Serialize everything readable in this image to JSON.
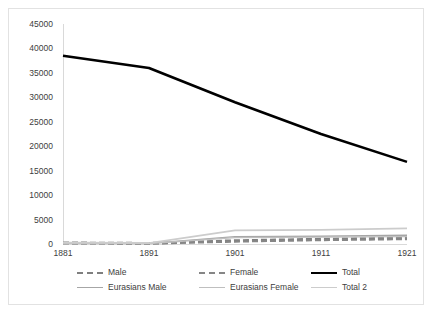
{
  "chart_data": {
    "type": "line",
    "title": "",
    "subtitle": "",
    "xlabel": "",
    "ylabel": "",
    "categories": [
      "1881",
      "1891",
      "1901",
      "1911",
      "1921"
    ],
    "x": [
      1881,
      1891,
      1901,
      1911,
      1921
    ],
    "xlim": [
      1881,
      1921
    ],
    "ylim": [
      0,
      45000
    ],
    "y_ticks": [
      "0",
      "5000",
      "10000",
      "15000",
      "20000",
      "25000",
      "30000",
      "35000",
      "40000",
      "45000"
    ],
    "y_tick_values": [
      0,
      5000,
      10000,
      15000,
      20000,
      25000,
      30000,
      35000,
      40000,
      45000
    ],
    "grid": false,
    "legend_position": "bottom",
    "series": [
      {
        "name": "Male",
        "values": [
          250,
          150,
          700,
          1000,
          1250
        ],
        "color": "#7f7f7f",
        "style": "dashed",
        "width": 2.6
      },
      {
        "name": "Female",
        "values": [
          120,
          80,
          500,
          800,
          1000
        ],
        "color": "#868686",
        "style": "dashed",
        "width": 2.2
      },
      {
        "name": "Total",
        "values": [
          38500,
          36000,
          29000,
          22500,
          16800
        ],
        "color": "#000000",
        "style": "solid",
        "width": 2.6
      },
      {
        "name": "Eurasians Male",
        "values": [
          200,
          120,
          1500,
          1600,
          1800
        ],
        "color": "#a6a6a6",
        "style": "solid",
        "width": 1.4
      },
      {
        "name": "Eurasians Female",
        "values": [
          150,
          100,
          1300,
          1400,
          1500
        ],
        "color": "#bfbfbf",
        "style": "solid",
        "width": 1.4
      },
      {
        "name": "Total 2",
        "values": [
          300,
          200,
          2800,
          2900,
          3200
        ],
        "color": "#cccccc",
        "style": "solid",
        "width": 1.8
      }
    ]
  },
  "legend": {
    "rows": [
      [
        {
          "label": "Male",
          "color": "#7f7f7f",
          "style": "dashed",
          "name": "legend-item-male"
        },
        {
          "label": "Female",
          "color": "#868686",
          "style": "dashed",
          "name": "legend-item-female"
        },
        {
          "label": "Total",
          "color": "#000000",
          "style": "solid",
          "name": "legend-item-total"
        }
      ],
      [
        {
          "label": "Eurasians Male",
          "color": "#a6a6a6",
          "style": "solid",
          "name": "legend-item-eurasians-male"
        },
        {
          "label": "Eurasians Female",
          "color": "#bfbfbf",
          "style": "solid",
          "name": "legend-item-eurasians-female"
        },
        {
          "label": "Total 2",
          "color": "#cccccc",
          "style": "solid",
          "name": "legend-item-total-2"
        }
      ]
    ]
  },
  "colors": {
    "axis_text": "#404040",
    "axis_line": "#d9d9d9",
    "figure_border": "#e2e2e2",
    "background": "#ffffff"
  }
}
